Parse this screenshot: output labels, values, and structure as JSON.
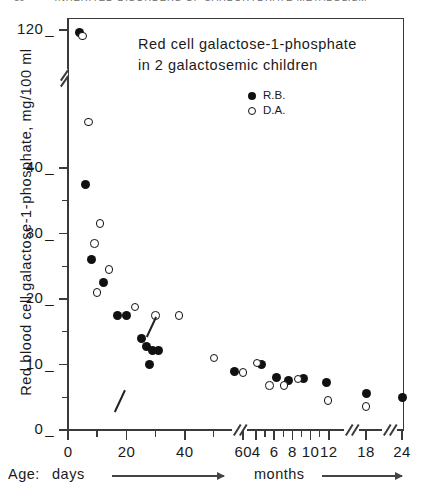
{
  "running_head": {
    "page_number": "30",
    "text": "INHERITED DISORDERS OF CARBOHYDRATE METABOLISM"
  },
  "chart_title": {
    "line1": "Red cell galactose-1-phosphate",
    "line2": "in 2 galactosemic children"
  },
  "axes": {
    "y_title": "Red blood cell  galactose-1-phosphate,  mg/100 ml",
    "y_ticks": [
      "0",
      "10",
      "20",
      "30",
      "40",
      "120"
    ],
    "x_age_label": "Age:",
    "x_days_label": "days",
    "x_months_label": "months",
    "x_days_ticks": [
      "0",
      "20",
      "40",
      "60"
    ],
    "x_months_ticks": [
      "4",
      "6",
      "8",
      "10",
      "12",
      "18",
      "24"
    ]
  },
  "legend": {
    "position": "inside-top-right",
    "entries": [
      {
        "marker": "filled-circle",
        "label": "R.B."
      },
      {
        "marker": "open-circle",
        "label": "D.A."
      }
    ]
  },
  "annotations": [
    {
      "name": "treatment-pointer-upper",
      "style": "diagonal-stroke"
    },
    {
      "name": "treatment-pointer-lower",
      "style": "diagonal-stroke"
    }
  ],
  "chart_data": {
    "type": "scatter",
    "title": "Red cell galactose-1-phosphate in 2 galactosemic children",
    "xlabel": "Age",
    "ylabel": "Red blood cell galactose-1-phosphate, mg/100 ml",
    "grid": false,
    "legend_position": "inside-top-right",
    "ylim": [
      0,
      45
    ],
    "y_broken_axis": true,
    "y_break_between": [
      45,
      112
    ],
    "y_upper_range": [
      112,
      124
    ],
    "x_broken_axis": true,
    "x_segments": [
      {
        "unit": "days",
        "range": [
          0,
          62
        ]
      },
      {
        "unit": "months",
        "range": [
          3.4,
          12.6
        ]
      },
      {
        "unit": "months",
        "range": [
          17.2,
          18.8
        ]
      },
      {
        "unit": "months",
        "range": [
          23.2,
          24.8
        ]
      }
    ],
    "series": [
      {
        "name": "R.B.",
        "marker": "filled-circle",
        "points": [
          {
            "x": 4,
            "x_unit": "days",
            "y": 119
          },
          {
            "x": 6,
            "x_unit": "days",
            "y": 37.5
          },
          {
            "x": 8,
            "x_unit": "days",
            "y": 26
          },
          {
            "x": 12,
            "x_unit": "days",
            "y": 22.5
          },
          {
            "x": 17,
            "x_unit": "days",
            "y": 17.5
          },
          {
            "x": 20,
            "x_unit": "days",
            "y": 17.5
          },
          {
            "x": 25,
            "x_unit": "days",
            "y": 14
          },
          {
            "x": 27,
            "x_unit": "days",
            "y": 12.8
          },
          {
            "x": 29,
            "x_unit": "days",
            "y": 12.2
          },
          {
            "x": 31,
            "x_unit": "days",
            "y": 12.2
          },
          {
            "x": 28,
            "x_unit": "days",
            "y": 10
          },
          {
            "x": 57,
            "x_unit": "days",
            "y": 9
          },
          {
            "x": 4.6,
            "x_unit": "months",
            "y": 10
          },
          {
            "x": 6.2,
            "x_unit": "months",
            "y": 8
          },
          {
            "x": 7.6,
            "x_unit": "months",
            "y": 7.6
          },
          {
            "x": 9.2,
            "x_unit": "months",
            "y": 7.8
          },
          {
            "x": 11.8,
            "x_unit": "months",
            "y": 7.2
          },
          {
            "x": 18,
            "x_unit": "months",
            "y": 5.5
          },
          {
            "x": 24,
            "x_unit": "months",
            "y": 5
          }
        ]
      },
      {
        "name": "D.A.",
        "marker": "open-circle",
        "points": [
          {
            "x": 5,
            "x_unit": "days",
            "y": 117
          },
          {
            "x": 7,
            "x_unit": "days",
            "y": 47
          },
          {
            "x": 11,
            "x_unit": "days",
            "y": 31.5
          },
          {
            "x": 9,
            "x_unit": "days",
            "y": 28.5
          },
          {
            "x": 14,
            "x_unit": "days",
            "y": 24.5
          },
          {
            "x": 10,
            "x_unit": "days",
            "y": 21
          },
          {
            "x": 23,
            "x_unit": "days",
            "y": 18.8
          },
          {
            "x": 30,
            "x_unit": "days",
            "y": 17.5
          },
          {
            "x": 38,
            "x_unit": "days",
            "y": 17.5
          },
          {
            "x": 50,
            "x_unit": "days",
            "y": 11
          },
          {
            "x": 60,
            "x_unit": "days",
            "y": 8.8
          },
          {
            "x": 4.1,
            "x_unit": "months",
            "y": 10.2
          },
          {
            "x": 5.5,
            "x_unit": "months",
            "y": 6.8
          },
          {
            "x": 7.1,
            "x_unit": "months",
            "y": 6.8
          },
          {
            "x": 8.6,
            "x_unit": "months",
            "y": 7.8
          },
          {
            "x": 11.9,
            "x_unit": "months",
            "y": 4.5
          },
          {
            "x": 18,
            "x_unit": "months",
            "y": 3.6
          }
        ]
      }
    ]
  },
  "colors": {
    "ink": "#1a1a1a",
    "axis": "#3a3a3a",
    "marker": "#111111",
    "paper": "#ffffff"
  }
}
